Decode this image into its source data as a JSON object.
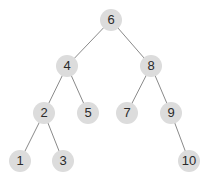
{
  "diagram": {
    "type": "binary-search-tree",
    "colors": {
      "node_fill": "#dcdcdc",
      "text": "#2a2a2a",
      "edge": "#8a8a8a",
      "background": "#ffffff"
    },
    "nodes": [
      {
        "id": "n6",
        "label": "6",
        "x": 111,
        "y": 20
      },
      {
        "id": "n4",
        "label": "4",
        "x": 67,
        "y": 66
      },
      {
        "id": "n8",
        "label": "8",
        "x": 151,
        "y": 66
      },
      {
        "id": "n2",
        "label": "2",
        "x": 44,
        "y": 113
      },
      {
        "id": "n5",
        "label": "5",
        "x": 88,
        "y": 113
      },
      {
        "id": "n7",
        "label": "7",
        "x": 127,
        "y": 113
      },
      {
        "id": "n9",
        "label": "9",
        "x": 171,
        "y": 113
      },
      {
        "id": "n1",
        "label": "1",
        "x": 20,
        "y": 161
      },
      {
        "id": "n3",
        "label": "3",
        "x": 63,
        "y": 161
      },
      {
        "id": "n10",
        "label": "10",
        "x": 189,
        "y": 161
      }
    ],
    "edges": [
      [
        "n6",
        "n4"
      ],
      [
        "n6",
        "n8"
      ],
      [
        "n4",
        "n2"
      ],
      [
        "n4",
        "n5"
      ],
      [
        "n8",
        "n7"
      ],
      [
        "n8",
        "n9"
      ],
      [
        "n2",
        "n1"
      ],
      [
        "n2",
        "n3"
      ],
      [
        "n9",
        "n10"
      ]
    ]
  }
}
